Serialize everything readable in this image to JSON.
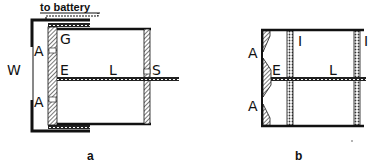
{
  "diagram_a": {
    "caption": "a",
    "labels": {
      "battery": "to battery",
      "W": "W",
      "A_top": "A",
      "A_bottom": "A",
      "G": "G",
      "E": "E",
      "L": "L",
      "S": "S"
    }
  },
  "diagram_b": {
    "caption": "b",
    "labels": {
      "A_top": "A",
      "A_bottom": "A",
      "E": "E",
      "L": "L",
      "I_left": "I",
      "I_right": "I"
    }
  },
  "colors": {
    "ink": "#111111",
    "background": "#ffffff"
  }
}
